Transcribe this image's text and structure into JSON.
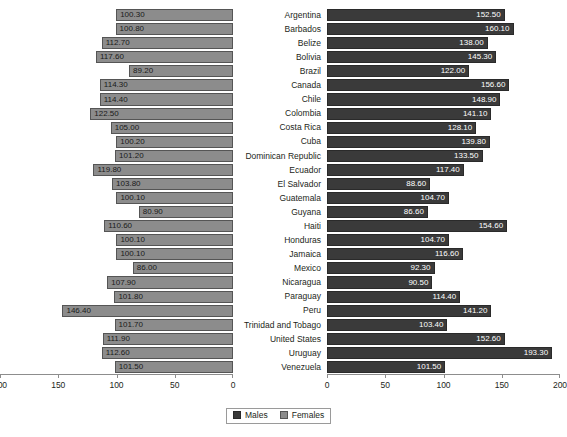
{
  "chart_data": {
    "type": "bar",
    "title": "",
    "subtitle": "",
    "orientation": "horizontal",
    "layout": "butterfly-population-pyramid",
    "xlabel": "",
    "ylabel": "",
    "grid": false,
    "legend_position": "bottom-center",
    "left_panel": {
      "series_name": "Females",
      "color": "#8c8c8c",
      "axis_direction": "right-to-left",
      "xlim": [
        0,
        200
      ],
      "ticks": [
        200,
        150,
        100,
        50,
        0
      ],
      "tick_labels": [
        "200",
        "150",
        "100",
        "50",
        "0"
      ]
    },
    "right_panel": {
      "series_name": "Males",
      "color": "#3a3a3a",
      "axis_direction": "left-to-right",
      "xlim": [
        0,
        200
      ],
      "ticks": [
        0,
        50,
        100,
        150,
        200
      ],
      "tick_labels": [
        "0",
        "50",
        "100",
        "150",
        "200"
      ]
    },
    "categories": [
      "Argentina",
      "Barbados",
      "Belize",
      "Bolivia",
      "Brazil",
      "Canada",
      "Chile",
      "Colombia",
      "Costa Rica",
      "Cuba",
      "Dominican Republic",
      "Ecuador",
      "El Salvador",
      "Guatemala",
      "Guyana",
      "Haiti",
      "Honduras",
      "Jamaica",
      "Mexico",
      "Nicaragua",
      "Paraguay",
      "Peru",
      "Trinidad and Tobago",
      "United States",
      "Uruguay",
      "Venezuela"
    ],
    "series": [
      {
        "name": "Females",
        "side": "left",
        "color": "#8c8c8c",
        "values": [
          100.3,
          100.8,
          112.7,
          117.6,
          89.2,
          114.3,
          114.4,
          122.5,
          105.0,
          100.2,
          101.2,
          119.8,
          103.8,
          100.1,
          80.9,
          110.6,
          100.1,
          100.1,
          86.0,
          107.9,
          101.8,
          146.4,
          101.7,
          111.9,
          112.6,
          101.5
        ],
        "labels": [
          "100.30",
          "100.80",
          "112.70",
          "117.60",
          "89.20",
          "114.30",
          "114.40",
          "122.50",
          "105.00",
          "100.20",
          "101.20",
          "119.80",
          "103.80",
          "100.10",
          "80.90",
          "110.60",
          "100.10",
          "100.10",
          "86.00",
          "107.90",
          "101.80",
          "146.40",
          "101.70",
          "111.90",
          "112.60",
          "101.50"
        ]
      },
      {
        "name": "Males",
        "side": "right",
        "color": "#3a3a3a",
        "values": [
          152.5,
          160.1,
          138.0,
          145.3,
          122.0,
          156.6,
          148.9,
          141.1,
          128.1,
          139.8,
          133.5,
          117.4,
          88.6,
          104.7,
          86.6,
          154.6,
          104.7,
          116.6,
          92.3,
          90.5,
          114.4,
          141.2,
          103.4,
          152.6,
          193.3,
          101.5
        ],
        "labels": [
          "152.50",
          "160.10",
          "138.00",
          "145.30",
          "122.00",
          "156.60",
          "148.90",
          "141.10",
          "128.10",
          "139.80",
          "133.50",
          "117.40",
          "88.60",
          "104.70",
          "86.60",
          "154.60",
          "104.70",
          "116.60",
          "92.30",
          "90.50",
          "114.40",
          "141.20",
          "103.40",
          "152.60",
          "193.30",
          "101.50"
        ]
      }
    ]
  },
  "legend": {
    "items": [
      {
        "label": "Males",
        "color": "#3a3a3a"
      },
      {
        "label": "Females",
        "color": "#8c8c8c"
      }
    ]
  },
  "colors": {
    "males": "#3a3a3a",
    "females": "#8c8c8c",
    "axis": "#8d8d8d",
    "text": "#231f20",
    "background": "#ffffff"
  }
}
